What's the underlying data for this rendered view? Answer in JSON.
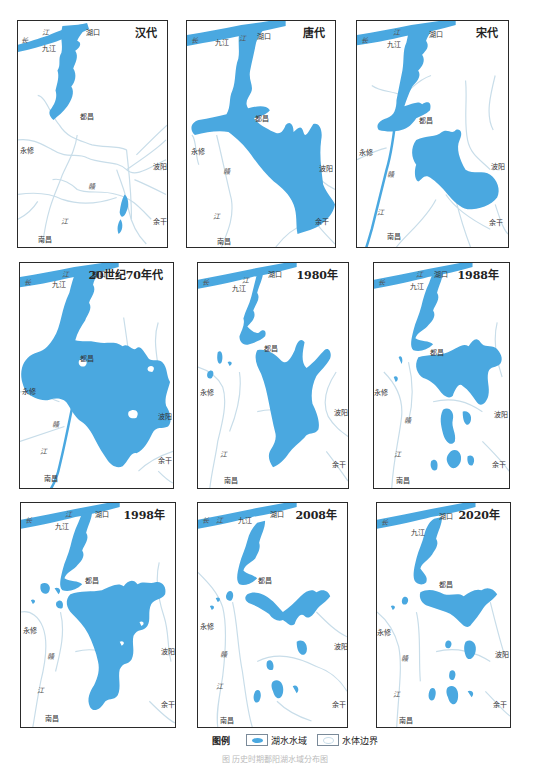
{
  "colors": {
    "lake_water": "#4aa8e0",
    "river": "#c8dde9",
    "yangtze": "#4aa8e0",
    "frame": "#2a2a2a"
  },
  "place_labels": {
    "chang": "长",
    "jiang": "江",
    "jiujiang": "九江",
    "hukou": "湖口",
    "duchang": "都昌",
    "yongxiu": "永修",
    "gan": "赣",
    "gan_jiang": "江",
    "nanchang": "南昌",
    "boyang": "波阳",
    "yugan": "余干"
  },
  "panels": [
    {
      "era": "汉代"
    },
    {
      "era": "唐代"
    },
    {
      "era": "宋代"
    },
    {
      "era": "20世纪70年代"
    },
    {
      "era": "1980年"
    },
    {
      "era": "1988年"
    },
    {
      "era": "1998年"
    },
    {
      "era": "2008年"
    },
    {
      "era": "2020年"
    }
  ],
  "legend": {
    "title": "图例",
    "items": [
      {
        "label": "湖水水域",
        "icon": "lake-water-swatch"
      },
      {
        "label": "水体边界",
        "icon": "water-boundary-swatch"
      }
    ]
  },
  "caption": "图  历史时期鄱阳湖水域分布图"
}
